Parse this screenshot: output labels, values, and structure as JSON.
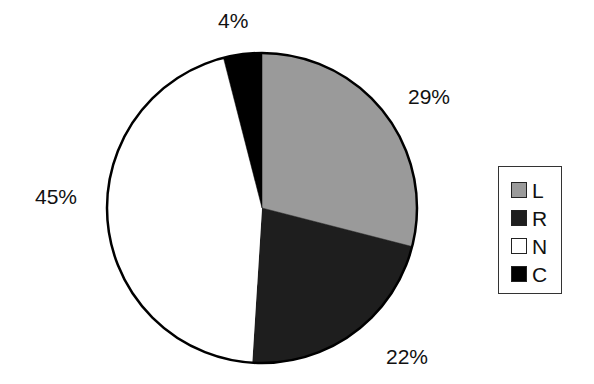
{
  "chart_data": {
    "type": "pie",
    "title": "",
    "categories": [
      "L",
      "R",
      "N",
      "C"
    ],
    "values": [
      29,
      22,
      45,
      4
    ],
    "labels": [
      "29%",
      "22%",
      "45%",
      "4%"
    ],
    "colors": [
      "#9a9a9a",
      "#1e1e1e",
      "#ffffff",
      "#000000"
    ],
    "start_angle": "12 o'clock",
    "direction": "clockwise",
    "legend_position": "right"
  },
  "legend": {
    "items": [
      {
        "label": "L",
        "color": "#9a9a9a"
      },
      {
        "label": "R",
        "color": "#1e1e1e"
      },
      {
        "label": "N",
        "color": "#ffffff"
      },
      {
        "label": "C",
        "color": "#000000"
      }
    ]
  },
  "slice_labels": {
    "L": "29%",
    "R": "22%",
    "N": "45%",
    "C": "4%"
  }
}
